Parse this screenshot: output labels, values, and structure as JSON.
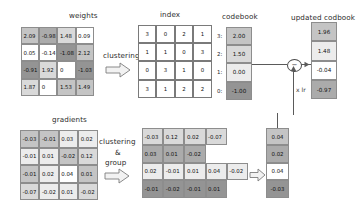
{
  "figure": {
    "title_weights": "weights",
    "title_index": "index",
    "title_codebook": "codebook",
    "title_updated_codebook": "updated codbook",
    "title_gradients": "gradients",
    "label_clustering": "clustering",
    "label_clustering_group_line1": "clustering",
    "label_clustering_group_line2": "&",
    "label_clustering_group_line3": "group",
    "label_lr": "x lr",
    "subtract_symbol": "−"
  },
  "chart_data": {
    "type": "table",
    "weights": {
      "label": "weights",
      "rows": [
        [
          {
            "v": "2.09",
            "g": "g3"
          },
          {
            "v": "-0.98",
            "g": "g4"
          },
          {
            "v": "1.48",
            "g": "g2"
          },
          {
            "v": "0.09",
            "g": "g0"
          }
        ],
        [
          {
            "v": "0.05",
            "g": "g0"
          },
          {
            "v": "-0.14",
            "g": "g0"
          },
          {
            "v": "-1.08",
            "g": "g5"
          },
          {
            "v": "2.12",
            "g": "g3"
          }
        ],
        [
          {
            "v": "-0.91",
            "g": "g5"
          },
          {
            "v": "1.92",
            "g": "g2"
          },
          {
            "v": "0",
            "g": "g0"
          },
          {
            "v": "-1.03",
            "g": "g5"
          }
        ],
        [
          {
            "v": "1.87",
            "g": "g2"
          },
          {
            "v": "0",
            "g": "g0"
          },
          {
            "v": "1.53",
            "g": "g3"
          },
          {
            "v": "1.49",
            "g": "g3"
          }
        ]
      ]
    },
    "index": {
      "label": "index",
      "rows": [
        [
          "3",
          "0",
          "2",
          "1"
        ],
        [
          "1",
          "1",
          "0",
          "3"
        ],
        [
          "0",
          "3",
          "1",
          "0"
        ],
        [
          "3",
          "1",
          "2",
          "2"
        ]
      ]
    },
    "codebook": {
      "label": "codebook",
      "keys": [
        "3:",
        "2:",
        "1:",
        "0:"
      ],
      "values": [
        "2.00",
        "1.50",
        "0.00",
        "-1.00"
      ],
      "shades": [
        "g3",
        "g2",
        "g1",
        "g5"
      ]
    },
    "updated_codebook": {
      "label": "updated codbook",
      "values": [
        "1.96",
        "1.48",
        "-0.04",
        "-0.97"
      ],
      "shades": [
        "g3",
        "g1",
        "g0",
        "g4"
      ]
    },
    "gradients": {
      "label": "gradients",
      "rows": [
        [
          {
            "v": "-0.03",
            "g": "g3"
          },
          {
            "v": "-0.01",
            "g": "g3"
          },
          {
            "v": "0.03",
            "g": "g1"
          },
          {
            "v": "0.02",
            "g": "g1"
          }
        ],
        [
          {
            "v": "-0.01",
            "g": "g1"
          },
          {
            "v": "0.01",
            "g": "g1"
          },
          {
            "v": "-0.02",
            "g": "g3"
          },
          {
            "v": "0.12",
            "g": "g2"
          }
        ],
        [
          {
            "v": "-0.01",
            "g": "g3"
          },
          {
            "v": "0.02",
            "g": "g1"
          },
          {
            "v": "0.04",
            "g": "g0"
          },
          {
            "v": "0.01",
            "g": "g3"
          }
        ],
        [
          {
            "v": "-0.07",
            "g": "g2"
          },
          {
            "v": "-0.02",
            "g": "g1"
          },
          {
            "v": "0.01",
            "g": "g1"
          },
          {
            "v": "-0.02",
            "g": "g2"
          }
        ]
      ]
    },
    "grouped_gradients": {
      "label": "grouped gradients",
      "rows": [
        [
          {
            "v": "-0.03",
            "g": "g2"
          },
          {
            "v": "0.12",
            "g": "g2"
          },
          {
            "v": "0.02",
            "g": "g2"
          },
          {
            "v": "-0.07",
            "g": "g2"
          },
          {
            "v": "",
            "g": "empty"
          }
        ],
        [
          {
            "v": "0.03",
            "g": "g4"
          },
          {
            "v": "0.01",
            "g": "g4"
          },
          {
            "v": "-0.02",
            "g": "g4"
          },
          {
            "v": "",
            "g": "empty"
          },
          {
            "v": "",
            "g": "empty"
          }
        ],
        [
          {
            "v": "0.02",
            "g": "g1"
          },
          {
            "v": "-0.01",
            "g": "g1"
          },
          {
            "v": "0.01",
            "g": "g1"
          },
          {
            "v": "0.04",
            "g": "g1"
          },
          {
            "v": "-0.02",
            "g": "g1"
          }
        ],
        [
          {
            "v": "-0.01",
            "g": "g5"
          },
          {
            "v": "-0.02",
            "g": "g5"
          },
          {
            "v": "-0.01",
            "g": "g5"
          },
          {
            "v": "0.01",
            "g": "g5"
          },
          {
            "v": "",
            "g": "empty"
          }
        ]
      ]
    },
    "reduced_gradients": {
      "label": "summed gradients",
      "values": [
        "0.04",
        "0.02",
        "0.04",
        "-0.03"
      ],
      "shades": [
        "g3",
        "g4",
        "g0",
        "g5"
      ]
    }
  }
}
